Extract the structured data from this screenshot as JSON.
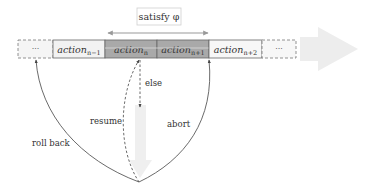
{
  "condition_label": "satisfy φ",
  "timeline": {
    "cells": [
      {
        "id": "ellipsis-left",
        "label": "···",
        "style": "dashed"
      },
      {
        "id": "action-n-minus-1",
        "base": "action",
        "sub": "n−1",
        "style": "light"
      },
      {
        "id": "action-n",
        "base": "action",
        "sub": "n",
        "style": "dark"
      },
      {
        "id": "action-n-plus-1",
        "base": "action",
        "sub": "n+1",
        "style": "dark"
      },
      {
        "id": "action-n-plus-2",
        "base": "action",
        "sub": "n+2",
        "style": "light"
      },
      {
        "id": "ellipsis-right",
        "label": "···",
        "style": "dashed"
      }
    ]
  },
  "edges": {
    "else": "else",
    "resume": "resume",
    "abort": "abort",
    "roll_back": "roll back"
  },
  "colors": {
    "dark_cell": "#a9a9a9",
    "light_cell": "#f2f2f2",
    "big_arrow": "#ebebeb",
    "line": "#555555"
  }
}
